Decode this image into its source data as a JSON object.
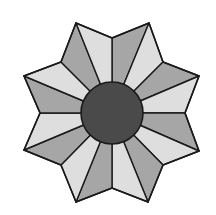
{
  "figure": {
    "type": "eight-pointed star with central circle",
    "center": [
      112,
      113
    ],
    "hub_radius": 31,
    "colors": {
      "background": "#ffffff",
      "light_facet": "#dedede",
      "dark_facet": "#a6a6a6",
      "hub": "#4a4a4a",
      "stroke": "#1a1a1a"
    },
    "outline_points": [
      [
        112,
        38
      ],
      [
        149,
        23
      ],
      [
        163,
        62
      ],
      [
        199,
        76
      ],
      [
        185,
        113
      ],
      [
        199,
        151
      ],
      [
        163,
        165
      ],
      [
        148,
        202
      ],
      [
        112,
        188
      ],
      [
        76,
        202
      ],
      [
        61,
        165
      ],
      [
        24,
        150
      ],
      [
        40,
        113
      ],
      [
        24,
        76
      ],
      [
        61,
        62
      ],
      [
        76,
        23
      ]
    ],
    "facet_shades": [
      "dark",
      "light",
      "dark",
      "light",
      "dark",
      "light",
      "dark",
      "light",
      "dark",
      "light",
      "dark",
      "light",
      "dark",
      "light",
      "dark",
      "light"
    ],
    "point_count": 8
  }
}
